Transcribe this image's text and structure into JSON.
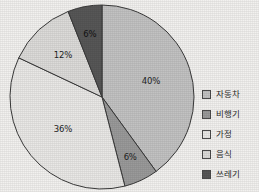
{
  "chart_data": {
    "type": "pie",
    "title": "",
    "subtitle": "",
    "xlabel": "",
    "ylabel": "",
    "grid": false,
    "legend_position": "right",
    "start_angle_deg": 0,
    "direction": "clockwise",
    "categories": [
      "자동차",
      "비행기",
      "가정",
      "음식",
      "쓰레기"
    ],
    "values": [
      40,
      6,
      36,
      12,
      6
    ],
    "value_labels": [
      "40%",
      "6%",
      "36%",
      "12%",
      "6%"
    ],
    "colors": [
      "#c2c2c2",
      "#9a9a9a",
      "#e9e8e6",
      "#dcdbd9",
      "#575757"
    ],
    "slices": [
      {
        "label": "자동차",
        "value": 40,
        "value_label": "40%",
        "color": "#c2c2c2"
      },
      {
        "label": "비행기",
        "value": 6,
        "value_label": "6%",
        "color": "#9a9a9a"
      },
      {
        "label": "가정",
        "value": 36,
        "value_label": "36%",
        "color": "#e9e8e6"
      },
      {
        "label": "음식",
        "value": 12,
        "value_label": "12%",
        "color": "#dcdbd9"
      },
      {
        "label": "쓰레기",
        "value": 6,
        "value_label": "6%",
        "color": "#575757"
      }
    ]
  },
  "chart": {
    "labels": {
      "auto": "40%",
      "plane": "6%",
      "home": "36%",
      "food": "12%",
      "waste": "6%"
    }
  },
  "legend": {
    "items": [
      {
        "label": "자동차",
        "color": "#c2c2c2"
      },
      {
        "label": "비행기",
        "color": "#9a9a9a"
      },
      {
        "label": "가정",
        "color": "#e9e8e6"
      },
      {
        "label": "음식",
        "color": "#dcdbd9"
      },
      {
        "label": "쓰레기",
        "color": "#575757"
      }
    ]
  },
  "style": {
    "background": "#f2f1ef",
    "outline": "#3a3a3a"
  }
}
